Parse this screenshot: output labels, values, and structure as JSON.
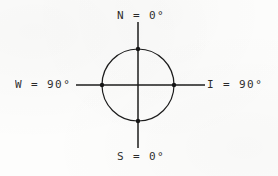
{
  "diagram": {
    "background_color": "#fdfdfc",
    "ink_color": "#1b1b1b",
    "center": {
      "x": 138,
      "y": 85
    },
    "circle": {
      "radius": 36
    },
    "vertical_axis": {
      "x": 138,
      "y_top": 22,
      "y_bottom": 148
    },
    "horizontal_axis": {
      "y": 85,
      "x_left": 76,
      "x_right": 205
    },
    "node_points": [
      {
        "name": "north-point",
        "x": 138,
        "y": 49
      },
      {
        "name": "east-point",
        "x": 174,
        "y": 85
      },
      {
        "name": "south-point",
        "x": 138,
        "y": 121
      },
      {
        "name": "west-point",
        "x": 102,
        "y": 85
      }
    ],
    "labels": {
      "north": "N = 0°",
      "south": "S = 0°",
      "west": "W = 90°",
      "east": "I = 90°"
    }
  }
}
